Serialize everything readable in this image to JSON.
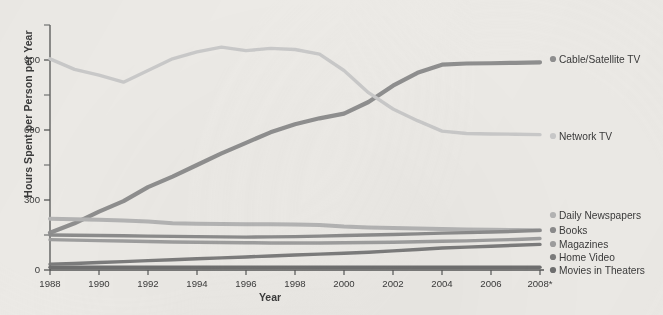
{
  "chart_data": {
    "type": "line",
    "title": "",
    "xlabel": "Year",
    "ylabel": "Hours Spent per Person per Year",
    "x": [
      1988,
      1989,
      1990,
      1991,
      1992,
      1993,
      1994,
      1995,
      1996,
      1997,
      1998,
      1999,
      2000,
      2001,
      2002,
      2003,
      2004,
      2005,
      2006,
      2007,
      2008
    ],
    "xtick_labels": [
      "1988",
      "1990",
      "1992",
      "1994",
      "1996",
      "1998",
      "2000",
      "2002",
      "2004",
      "2006",
      "2008*"
    ],
    "xtick_values": [
      1988,
      1990,
      1992,
      1994,
      1996,
      1998,
      2000,
      2002,
      2004,
      2006,
      2008
    ],
    "ytick_labels": [
      "0",
      "300",
      "600",
      "900"
    ],
    "ytick_values": [
      0,
      300,
      600,
      900
    ],
    "yminor_values": [
      150,
      450,
      750,
      1050
    ],
    "ylim": [
      0,
      1050
    ],
    "xlim": [
      1988,
      2008
    ],
    "grid": false,
    "legend_position": "right-aligned-to-series-end",
    "series": [
      {
        "name": "Cable/Satellite TV",
        "color": "#8f8f8f",
        "values": [
          160,
          200,
          250,
          295,
          355,
          400,
          450,
          500,
          545,
          590,
          625,
          650,
          670,
          720,
          790,
          845,
          880,
          885,
          886,
          888,
          890
        ]
      },
      {
        "name": "Network TV",
        "color": "#c9c9c9",
        "values": [
          905,
          860,
          835,
          805,
          855,
          905,
          935,
          955,
          940,
          950,
          945,
          925,
          855,
          760,
          690,
          640,
          595,
          585,
          583,
          582,
          580
        ]
      },
      {
        "name": "Daily Newspapers",
        "color": "#b4b4b4",
        "values": [
          220,
          218,
          215,
          212,
          208,
          200,
          198,
          197,
          196,
          196,
          195,
          193,
          186,
          182,
          180,
          178,
          176,
          174,
          172,
          171,
          170
        ]
      },
      {
        "name": "Books",
        "color": "#8c8c8c",
        "values": [
          150,
          149,
          148,
          147,
          145,
          144,
          143,
          142,
          141,
          142,
          143,
          145,
          148,
          150,
          152,
          155,
          158,
          160,
          163,
          166,
          170
        ]
      },
      {
        "name": "Magazines",
        "color": "#9e9e9e",
        "values": [
          130,
          128,
          126,
          124,
          122,
          120,
          119,
          118,
          117,
          116,
          116,
          116,
          117,
          118,
          119,
          121,
          123,
          125,
          128,
          131,
          135
        ]
      },
      {
        "name": "Home Video",
        "color": "#7c7c7c",
        "values": [
          25,
          28,
          32,
          36,
          40,
          44,
          48,
          52,
          56,
          60,
          64,
          68,
          72,
          76,
          82,
          88,
          94,
          98,
          102,
          106,
          110
        ]
      },
      {
        "name": "Movies in Theaters",
        "color": "#6f6f6f",
        "values": [
          12,
          12,
          12,
          12,
          12,
          12,
          12,
          12,
          12,
          12,
          12,
          12,
          12,
          12,
          12,
          12,
          12,
          12,
          12,
          12,
          12
        ]
      }
    ],
    "legend": [
      {
        "label": "Cable/Satellite TV",
        "color": "#8f8f8f"
      },
      {
        "label": "Network TV",
        "color": "#c9c9c9"
      },
      {
        "label": "Daily Newspapers",
        "color": "#b4b4b4"
      },
      {
        "label": "Books",
        "color": "#8c8c8c"
      },
      {
        "label": "Magazines",
        "color": "#9e9e9e"
      },
      {
        "label": "Home Video",
        "color": "#7c7c7c"
      },
      {
        "label": "Movies in Theaters",
        "color": "#6f6f6f"
      }
    ]
  }
}
